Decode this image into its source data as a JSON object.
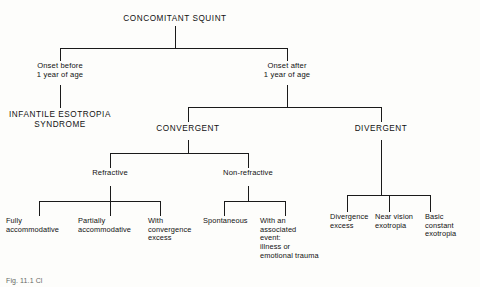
{
  "figure": {
    "kind": "flowchart",
    "orientation": "top-down-tree",
    "line_color": "#1a1a1a",
    "background_color": "#fdfdfb",
    "text_color": "#111111",
    "caption": "Fig.  11.1  Cl"
  },
  "nodes": {
    "root": "CONCOMITANT SQUINT",
    "onset_before": "Onset before\n1 year of age",
    "onset_after": "Onset after\n1 year of age",
    "infantile": "INFANTILE ESOTROPIA\nSYNDROME",
    "convergent": "CONVERGENT",
    "divergent": "DIVERGENT",
    "refractive": "Refractive",
    "non_refractive": "Non-refractive",
    "fully_accommodative": "Fully\naccommodative",
    "partially_accommodative": "Partially\naccommodative",
    "with_convergence_excess": "With\nconvergence\nexcess",
    "spontaneous": "Spontaneous",
    "with_associated_event": "With an\nassociated\nevent:\nillness or\nemotional trauma",
    "divergence_excess": "Divergence\nexcess",
    "near_vision_exotropia": "Near vision\nexotropia",
    "basic_constant_exotropia": "Basic\nconstant\nexotropia"
  },
  "tree": {
    "label": "CONCOMITANT SQUINT",
    "children": [
      {
        "label": "Onset before 1 year of age",
        "children": [
          {
            "label": "INFANTILE ESOTROPIA SYNDROME",
            "children": []
          }
        ]
      },
      {
        "label": "Onset after 1 year of age",
        "children": [
          {
            "label": "CONVERGENT",
            "children": [
              {
                "label": "Refractive",
                "children": [
                  {
                    "label": "Fully accommodative",
                    "children": []
                  },
                  {
                    "label": "Partially accommodative",
                    "children": []
                  },
                  {
                    "label": "With convergence excess",
                    "children": []
                  }
                ]
              },
              {
                "label": "Non-refractive",
                "children": [
                  {
                    "label": "Spontaneous",
                    "children": []
                  },
                  {
                    "label": "With an associated event: illness or emotional trauma",
                    "children": []
                  }
                ]
              }
            ]
          },
          {
            "label": "DIVERGENT",
            "children": [
              {
                "label": "Divergence excess",
                "children": []
              },
              {
                "label": "Near vision exotropia",
                "children": []
              },
              {
                "label": "Basic constant exotropia",
                "children": []
              }
            ]
          }
        ]
      }
    ]
  }
}
